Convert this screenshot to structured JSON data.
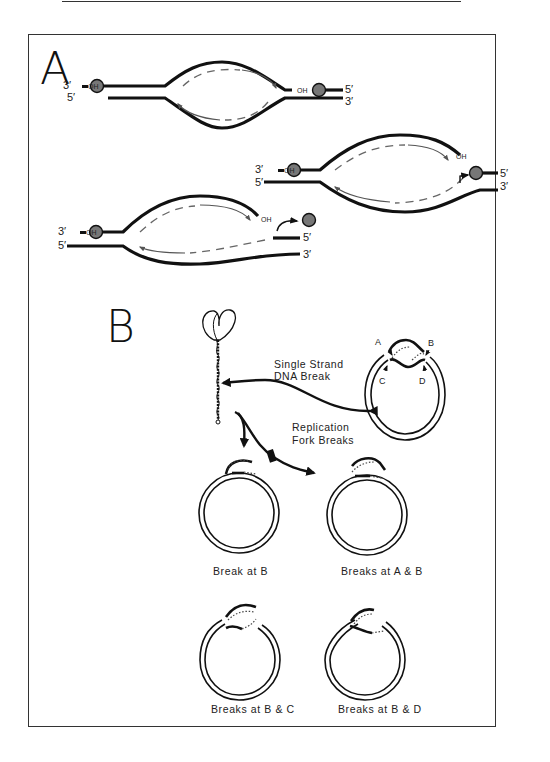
{
  "figure": {
    "panel_a": {
      "label": "A",
      "forks": [
        {
          "left_top": "3′",
          "left_oh": "OH",
          "left_bottom": "5′",
          "right_oh": "OH",
          "right_top": "5′",
          "right_bottom": "3′"
        },
        {
          "left_top": "3′",
          "left_oh": "OH",
          "left_bottom": "5′",
          "right_oh": "OH",
          "right_top": "5′",
          "right_bottom": "3′"
        },
        {
          "left_top": "3′",
          "left_oh": "OH",
          "left_bottom": "5′",
          "right_oh": "OH",
          "right_top": "5′",
          "right_bottom": "3′"
        }
      ]
    },
    "panel_b": {
      "label": "B",
      "arrow_labels": {
        "single_strand": [
          "Single Strand",
          "DNA Break"
        ],
        "replication_fork": [
          "Replication",
          "Fork Breaks"
        ]
      },
      "break_sites": [
        "A",
        "B",
        "C",
        "D"
      ],
      "captions": [
        "Break at B",
        "Breaks at A & B",
        "Breaks at B & C",
        "Breaks at B & D"
      ]
    }
  }
}
